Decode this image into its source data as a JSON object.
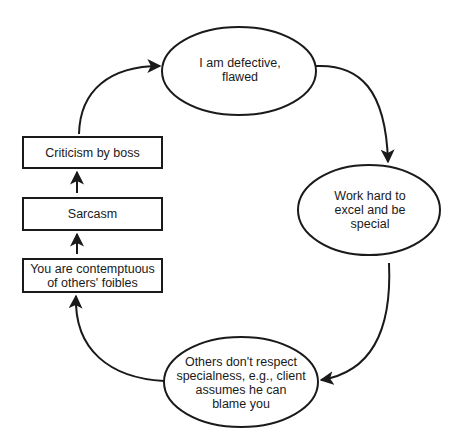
{
  "diagram": {
    "type": "cycle-flowchart",
    "ellipses": [
      {
        "id": "defective",
        "label": "I am defective,\nflawed"
      },
      {
        "id": "work-hard",
        "label": "Work hard to\nexcel and be\nspecial"
      },
      {
        "id": "others-dont-respect",
        "label": "Others don't respect\nspecialness, e.g., client\nassumes he can\nblame you"
      }
    ],
    "boxes": [
      {
        "id": "criticism",
        "label": "Criticism by boss"
      },
      {
        "id": "sarcasm",
        "label": "Sarcasm"
      },
      {
        "id": "contemptuous",
        "label": "You are contemptuous\nof others' foibles"
      }
    ],
    "edges": [
      {
        "from": "defective",
        "to": "work-hard"
      },
      {
        "from": "work-hard",
        "to": "others-dont-respect"
      },
      {
        "from": "others-dont-respect",
        "to": "contemptuous"
      },
      {
        "from": "contemptuous",
        "to": "sarcasm"
      },
      {
        "from": "sarcasm",
        "to": "criticism"
      },
      {
        "from": "criticism",
        "to": "defective"
      }
    ],
    "stroke_color": "#1a1a1a"
  }
}
